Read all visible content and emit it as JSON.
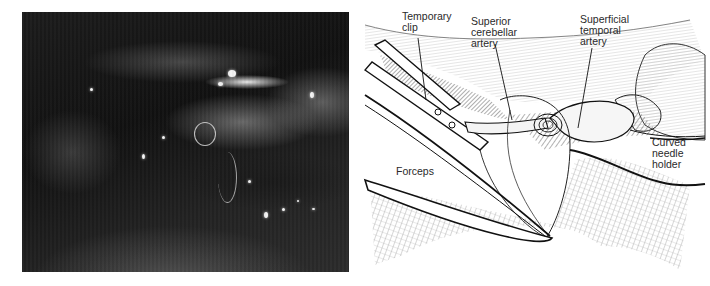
{
  "figure": {
    "photo": {
      "description": "Intraoperative photograph of microvascular anastomosis with suture",
      "tone": "grayscale"
    },
    "illustration": {
      "labels": [
        {
          "id": "temporary-clip",
          "text": "Temporary\nclip"
        },
        {
          "id": "superior-cerebellar-artery",
          "text": "Superior\ncerebellar\nartery"
        },
        {
          "id": "superficial-temporal-artery",
          "text": "Superficial\ntemporal\nartery"
        },
        {
          "id": "curved-needle-holder",
          "text": "Curved\nneedle\nholder"
        },
        {
          "id": "forceps",
          "text": "Forceps"
        }
      ]
    }
  },
  "colors": {
    "background": "#ffffff",
    "ink": "#1a1a1a",
    "label_text": "#2a2a2a",
    "hatch_gray": "#8a8a8a",
    "photo_dark": "#151515"
  }
}
